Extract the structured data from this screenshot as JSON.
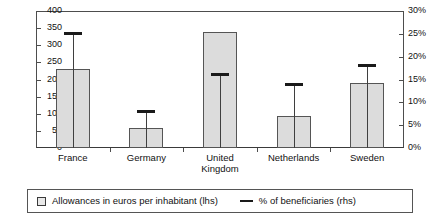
{
  "chart_data": {
    "type": "bar",
    "title": "",
    "subtitle": "",
    "xlabel": "",
    "ylabel": "",
    "categories": [
      "France",
      "Germany",
      "United\nKingdom",
      "Netherlands",
      "Sweden"
    ],
    "series": [
      {
        "name": "Allowances in euros per inhabitant (lhs)",
        "type": "bar",
        "axis": "left",
        "values": [
          230,
          58,
          340,
          92,
          190
        ]
      },
      {
        "name": "% of beneficiaries (rhs)",
        "type": "marker",
        "axis": "right",
        "values": [
          25,
          8,
          16,
          14,
          18
        ]
      }
    ],
    "left_axis": {
      "label": "",
      "min": 0,
      "max": 400,
      "step": 50,
      "ticks": [
        "0",
        "50",
        "100",
        "150",
        "200",
        "250",
        "300",
        "350",
        "400"
      ]
    },
    "right_axis": {
      "label": "",
      "min": 0,
      "max": 30,
      "step": 5,
      "ticks": [
        "0%",
        "5%",
        "10%",
        "15%",
        "20%",
        "25%",
        "30%"
      ]
    },
    "grid": false,
    "legend_position": "bottom",
    "colors": {
      "bar_fill": "#dcdcdc",
      "bar_border": "#555555",
      "marker": "#1a1a1a",
      "axis": "#4d4d4d",
      "background": "#ffffff"
    }
  },
  "legend": {
    "items": [
      {
        "marker": "square-icon",
        "label": "Allowances in euros per inhabitant (lhs)"
      },
      {
        "marker": "dash-icon",
        "label": "% of beneficiaries (rhs)"
      }
    ]
  }
}
